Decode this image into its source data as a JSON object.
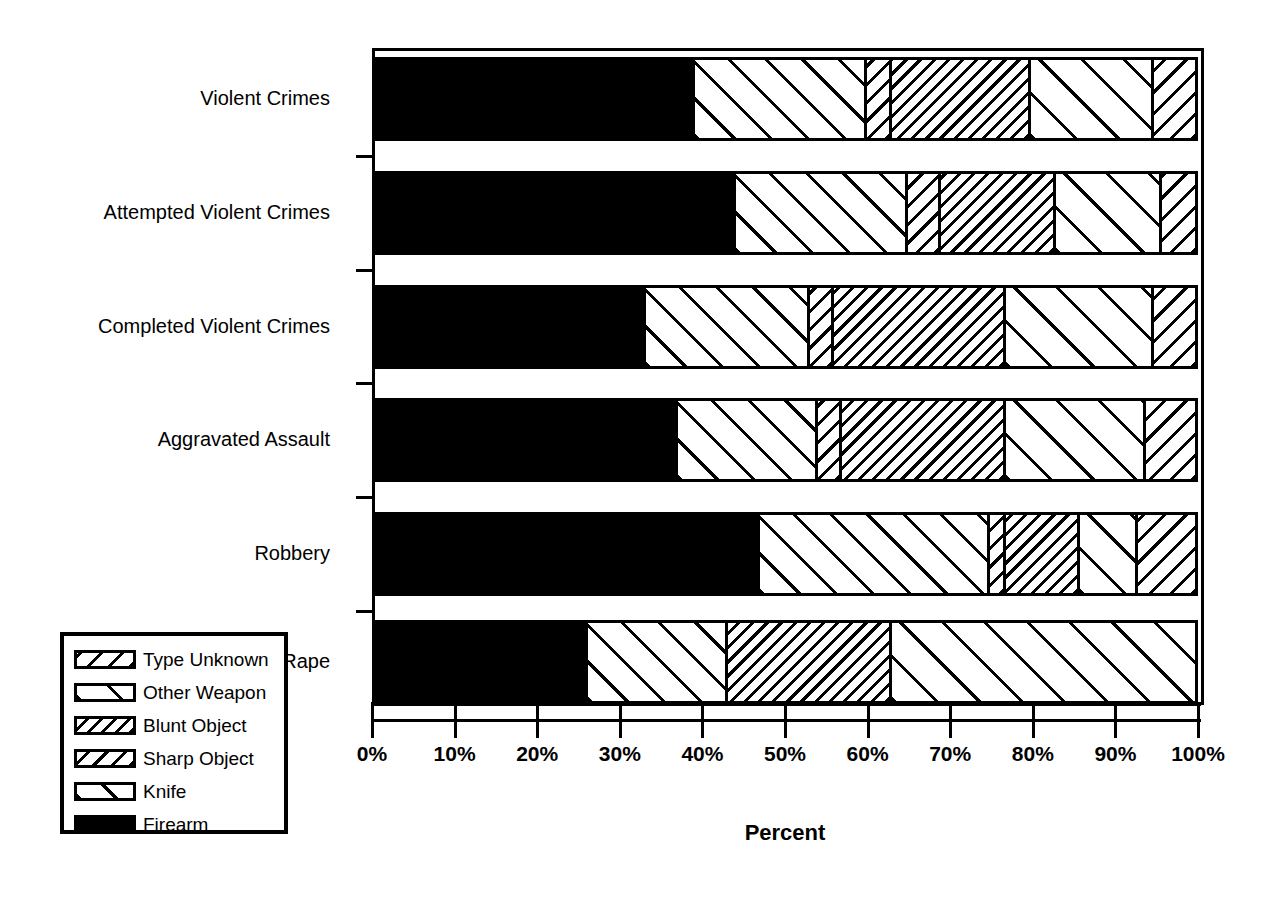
{
  "chart_data": {
    "type": "bar",
    "orientation": "horizontal",
    "stacked": true,
    "normalized": true,
    "title": "",
    "xlabel": "Percent",
    "ylabel": "",
    "xlim": [
      0,
      100
    ],
    "xticks": [
      "0%",
      "10%",
      "20%",
      "30%",
      "40%",
      "50%",
      "60%",
      "70%",
      "80%",
      "90%",
      "100%"
    ],
    "xtick_values": [
      0,
      10,
      20,
      30,
      40,
      50,
      60,
      70,
      80,
      90,
      100
    ],
    "grid": false,
    "legend_position": "lower-left",
    "categories": [
      "Violent Crimes",
      "Attempted Violent Crimes",
      "Completed Violent Crimes",
      "Aggravated Assault",
      "Robbery",
      "Rape"
    ],
    "series": [
      {
        "name": "Firearm",
        "pattern": "solid-black",
        "values": [
          39,
          44,
          33,
          37,
          47,
          26
        ]
      },
      {
        "name": "Knife",
        "pattern": "wide-diagonal-up",
        "values": [
          21,
          21,
          20,
          17,
          28,
          17
        ]
      },
      {
        "name": "Sharp Object",
        "pattern": "dense-diagonal-down",
        "values": [
          3,
          4,
          3,
          3,
          2,
          0
        ]
      },
      {
        "name": "Blunt Object",
        "pattern": "fine-diagonal-down",
        "values": [
          17,
          14,
          21,
          20,
          9,
          20
        ]
      },
      {
        "name": "Other Weapon",
        "pattern": "sparse-diagonal-up",
        "values": [
          15,
          13,
          18,
          17,
          7,
          37
        ]
      },
      {
        "name": "Type Unknown",
        "pattern": "medium-diagonal-down",
        "values": [
          5,
          4,
          5,
          6,
          7,
          0
        ]
      }
    ]
  },
  "legend": {
    "items": [
      {
        "label": "Type Unknown",
        "pattern_class": "p-unknown"
      },
      {
        "label": "Other Weapon",
        "pattern_class": "p-other"
      },
      {
        "label": "Blunt Object",
        "pattern_class": "p-blunt"
      },
      {
        "label": "Sharp Object",
        "pattern_class": "p-sharp"
      },
      {
        "label": "Knife",
        "pattern_class": "p-knife"
      },
      {
        "label": "Firearm",
        "pattern_class": "p-firearm"
      }
    ]
  },
  "axis": {
    "x_title": "Percent"
  },
  "colors": {
    "ink": "#000000",
    "paper": "#ffffff"
  }
}
